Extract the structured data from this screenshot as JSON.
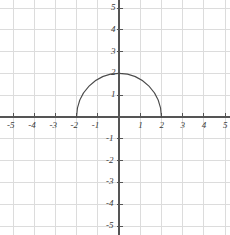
{
  "chart_data": {
    "type": "line",
    "title": "",
    "subtitle": "",
    "xlabel": "",
    "ylabel": "",
    "grid": true,
    "legend": false,
    "legend_position": "none",
    "xlim": [
      -5,
      5
    ],
    "ylim": [
      -5,
      5
    ],
    "x_ticks": [
      -5,
      -4,
      -3,
      -2,
      -1,
      1,
      2,
      3,
      4,
      5
    ],
    "y_ticks": [
      -5,
      -4,
      -3,
      -2,
      -1,
      1,
      2,
      3,
      4,
      5
    ],
    "x_tick_labels": [
      "-5",
      "-4",
      "-3",
      "-2",
      "-1",
      "1",
      "2",
      "3",
      "4",
      "5"
    ],
    "y_tick_labels": [
      "-5",
      "-4",
      "-3",
      "-2",
      "-1",
      "1",
      "2",
      "3",
      "4",
      "5"
    ],
    "origin_label": "",
    "grid_step": 1,
    "series": [
      {
        "name": "upper semicircle",
        "shape": "semicircle-upper",
        "equation": "y = sqrt(4 - x^2)",
        "center": [
          0,
          0
        ],
        "radius": 2,
        "x_start": -2,
        "x_end": 2,
        "peak": [
          0,
          2
        ],
        "endpoints": [
          [
            -2,
            0
          ],
          [
            2,
            0
          ]
        ],
        "x": [
          -2,
          -1.75,
          -1.5,
          -1.25,
          -1,
          -0.75,
          -0.5,
          -0.25,
          0,
          0.25,
          0.5,
          0.75,
          1,
          1.25,
          1.5,
          1.75,
          2
        ],
        "values": [
          0,
          0.97,
          1.32,
          1.56,
          1.73,
          1.85,
          1.94,
          1.98,
          2,
          1.98,
          1.94,
          1.85,
          1.73,
          1.56,
          1.32,
          0.97,
          0
        ]
      }
    ]
  },
  "colors": {
    "background": "#ffffff",
    "grid": "#dcdcdc",
    "axis": "#555555",
    "curve": "#4a4a4a",
    "tick_label": "#3a3a3a"
  },
  "axis_labels": {
    "x_negative": [
      {
        "text": "-5",
        "value": -5
      },
      {
        "text": "-4",
        "value": -4
      },
      {
        "text": "-3",
        "value": -3
      },
      {
        "text": "-2",
        "value": -2
      },
      {
        "text": "-1",
        "value": -1
      }
    ],
    "x_positive": [
      {
        "text": "1",
        "value": 1
      },
      {
        "text": "2",
        "value": 2
      },
      {
        "text": "3",
        "value": 3
      },
      {
        "text": "4",
        "value": 4
      },
      {
        "text": "5",
        "value": 5
      }
    ],
    "y_positive": [
      {
        "text": "1",
        "value": 1
      },
      {
        "text": "2",
        "value": 2
      },
      {
        "text": "3",
        "value": 3
      },
      {
        "text": "4",
        "value": 4
      },
      {
        "text": "5",
        "value": 5
      }
    ],
    "y_negative": [
      {
        "text": "-1",
        "value": -1
      },
      {
        "text": "-2",
        "value": -2
      },
      {
        "text": "-3",
        "value": -3
      },
      {
        "text": "-4",
        "value": -4
      },
      {
        "text": "-5",
        "value": -5
      }
    ]
  }
}
